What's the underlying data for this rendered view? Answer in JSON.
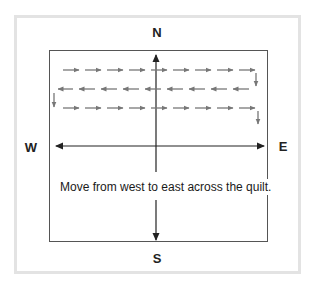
{
  "diagram": {
    "compass": {
      "north": "N",
      "south": "S",
      "west": "W",
      "east": "E"
    },
    "caption": "Move from west to east across the quilt.",
    "colors": {
      "frame_border": "#e3e3e3",
      "quilt_border": "#555555",
      "axis_color": "#222222",
      "path_arrows": "#777777"
    },
    "path_rows": [
      {
        "direction": "east",
        "arrow_count": 9
      },
      {
        "direction": "west",
        "arrow_count": 9
      },
      {
        "direction": "east",
        "arrow_count": 9
      }
    ]
  }
}
